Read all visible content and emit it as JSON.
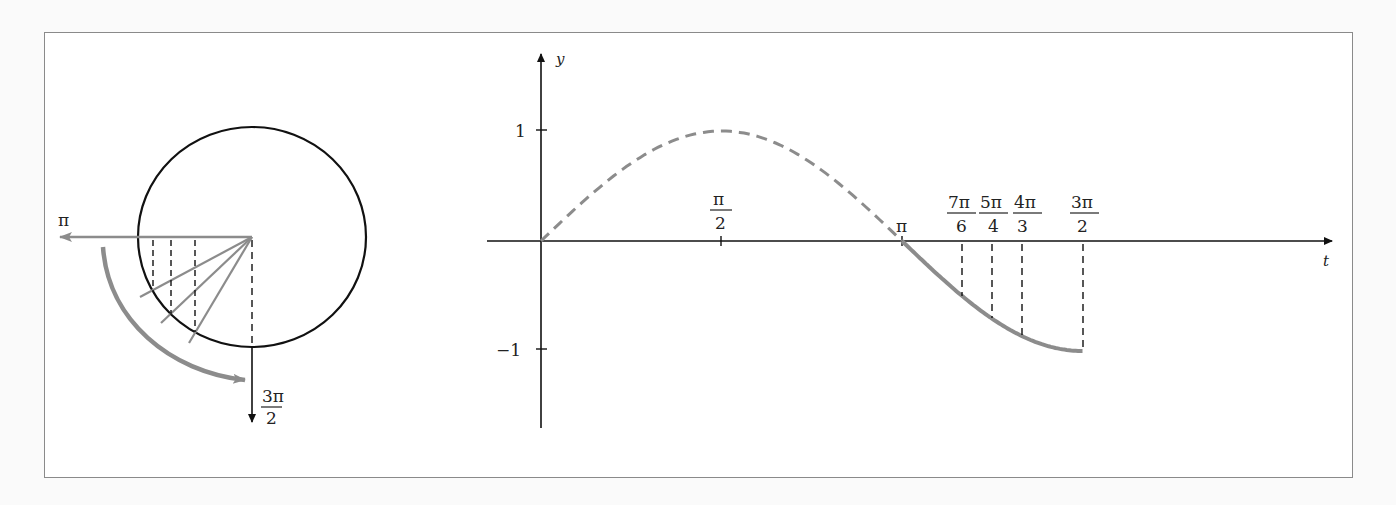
{
  "left_panel": {
    "title": "Unit circle",
    "labels": {
      "pi": "π",
      "three_pi_over_2_num": "3π",
      "three_pi_over_2_den": "2"
    },
    "rays_angles": [
      "7π/6",
      "5π/4",
      "4π/3"
    ]
  },
  "right_panel": {
    "axis_labels": {
      "x": "t",
      "y": "y"
    },
    "y_ticks": [
      {
        "value": 1,
        "label": "1"
      },
      {
        "value": -1,
        "label": "−1"
      }
    ],
    "x_ticks": [
      {
        "value": "π/2",
        "num": "π",
        "den": "2"
      },
      {
        "value": "π",
        "label": "π"
      },
      {
        "value": "7π/6",
        "num": "7π",
        "den": "6"
      },
      {
        "value": "5π/4",
        "num": "5π",
        "den": "4"
      },
      {
        "value": "4π/3",
        "num": "4π",
        "den": "3"
      },
      {
        "value": "3π/2",
        "num": "3π",
        "den": "2"
      }
    ]
  },
  "chart_data": {
    "type": "line",
    "title": "",
    "xlabel": "t",
    "ylabel": "y",
    "series": [
      {
        "name": "sin t on [0, π] (dashed)",
        "style": "dashed",
        "x": [
          0,
          0.785,
          1.571,
          2.356,
          3.142
        ],
        "values": [
          0,
          0.707,
          1,
          0.707,
          0
        ]
      },
      {
        "name": "sin t on [π, 3π/2] (solid)",
        "style": "solid",
        "x": [
          3.142,
          3.665,
          3.927,
          4.189,
          4.712
        ],
        "values": [
          0,
          -0.5,
          -0.707,
          -0.866,
          -1
        ]
      }
    ],
    "marked_points": [
      {
        "t": "7π/6",
        "y": -0.5
      },
      {
        "t": "5π/4",
        "y": -0.707
      },
      {
        "t": "4π/3",
        "y": -0.866
      },
      {
        "t": "3π/2",
        "y": -1
      }
    ],
    "ylim": [
      -1.7,
      1.7
    ],
    "grid": false
  }
}
